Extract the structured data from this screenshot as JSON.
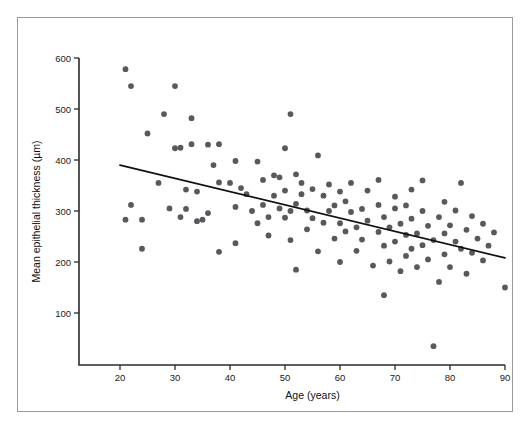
{
  "figure": {
    "frame_border_color": "#9a9a9a",
    "background_color": "#ffffff"
  },
  "caption": {
    "partial_text": ""
  },
  "chart_data": {
    "type": "scatter",
    "title": "",
    "subtitle": "",
    "xlabel": "Age (years)",
    "ylabel": "Mean epithelial thickness (µm)",
    "xlim": [
      13,
      92
    ],
    "ylim": [
      20,
      625
    ],
    "xticks": [
      20,
      30,
      40,
      50,
      60,
      70,
      80,
      90
    ],
    "xticklabels": [
      "20",
      "30",
      "40",
      "50",
      "60",
      "70",
      "80",
      "90"
    ],
    "yticks": [
      100,
      200,
      300,
      400,
      500,
      600
    ],
    "yticklabels": [
      "100",
      "200",
      "300",
      "400",
      "500",
      "600"
    ],
    "grid": false,
    "legend": null,
    "point_color": "#58585e",
    "point_size": 3.4,
    "annotations": [],
    "series": [
      {
        "name": "Mean epithelial thickness by age",
        "marker": "circle",
        "points": [
          [
            21,
            578
          ],
          [
            21,
            283
          ],
          [
            22,
            312
          ],
          [
            22,
            545
          ],
          [
            24,
            283
          ],
          [
            24,
            226
          ],
          [
            25,
            452
          ],
          [
            27,
            355
          ],
          [
            28,
            490
          ],
          [
            29,
            305
          ],
          [
            30,
            423
          ],
          [
            30,
            545
          ],
          [
            31,
            424
          ],
          [
            31,
            288
          ],
          [
            32,
            342
          ],
          [
            32,
            304
          ],
          [
            33,
            482
          ],
          [
            33,
            431
          ],
          [
            34,
            280
          ],
          [
            34,
            338
          ],
          [
            35,
            283
          ],
          [
            36,
            296
          ],
          [
            36,
            430
          ],
          [
            37,
            390
          ],
          [
            38,
            431
          ],
          [
            38,
            220
          ],
          [
            38,
            356
          ],
          [
            40,
            355
          ],
          [
            41,
            398
          ],
          [
            41,
            308
          ],
          [
            41,
            237
          ],
          [
            42,
            345
          ],
          [
            43,
            333
          ],
          [
            44,
            300
          ],
          [
            45,
            276
          ],
          [
            45,
            397
          ],
          [
            46,
            361
          ],
          [
            46,
            312
          ],
          [
            47,
            252
          ],
          [
            47,
            288
          ],
          [
            48,
            370
          ],
          [
            48,
            330
          ],
          [
            49,
            305
          ],
          [
            49,
            366
          ],
          [
            50,
            423
          ],
          [
            50,
            287
          ],
          [
            50,
            340
          ],
          [
            51,
            490
          ],
          [
            51,
            300
          ],
          [
            51,
            243
          ],
          [
            52,
            314
          ],
          [
            52,
            372
          ],
          [
            52,
            185
          ],
          [
            53,
            355
          ],
          [
            53,
            333
          ],
          [
            54,
            264
          ],
          [
            54,
            301
          ],
          [
            55,
            343
          ],
          [
            55,
            286
          ],
          [
            56,
            409
          ],
          [
            56,
            221
          ],
          [
            57,
            330
          ],
          [
            57,
            277
          ],
          [
            58,
            352
          ],
          [
            58,
            300
          ],
          [
            59,
            246
          ],
          [
            59,
            311
          ],
          [
            60,
            276
          ],
          [
            60,
            338
          ],
          [
            60,
            200
          ],
          [
            61,
            319
          ],
          [
            61,
            260
          ],
          [
            62,
            298
          ],
          [
            62,
            355
          ],
          [
            63,
            268
          ],
          [
            63,
            222
          ],
          [
            64,
            304
          ],
          [
            64,
            244
          ],
          [
            65,
            281
          ],
          [
            65,
            340
          ],
          [
            66,
            193
          ],
          [
            67,
            312
          ],
          [
            67,
            259
          ],
          [
            67,
            361
          ],
          [
            68,
            232
          ],
          [
            68,
            288
          ],
          [
            68,
            135
          ],
          [
            69,
            268
          ],
          [
            69,
            201
          ],
          [
            70,
            305
          ],
          [
            70,
            240
          ],
          [
            70,
            328
          ],
          [
            71,
            275
          ],
          [
            71,
            182
          ],
          [
            72,
            253
          ],
          [
            72,
            311
          ],
          [
            72,
            212
          ],
          [
            73,
            285
          ],
          [
            73,
            342
          ],
          [
            73,
            226
          ],
          [
            74,
            256
          ],
          [
            74,
            190
          ],
          [
            75,
            300
          ],
          [
            75,
            233
          ],
          [
            75,
            360
          ],
          [
            76,
            271
          ],
          [
            76,
            205
          ],
          [
            77,
            243
          ],
          [
            77,
            35
          ],
          [
            78,
            288
          ],
          [
            78,
            161
          ],
          [
            79,
            256
          ],
          [
            79,
            318
          ],
          [
            79,
            215
          ],
          [
            80,
            272
          ],
          [
            80,
            190
          ],
          [
            81,
            240
          ],
          [
            81,
            301
          ],
          [
            82,
            226
          ],
          [
            82,
            355
          ],
          [
            83,
            263
          ],
          [
            83,
            177
          ],
          [
            84,
            290
          ],
          [
            84,
            218
          ],
          [
            85,
            246
          ],
          [
            86,
            203
          ],
          [
            86,
            275
          ],
          [
            87,
            232
          ],
          [
            88,
            258
          ],
          [
            90,
            150
          ]
        ]
      }
    ],
    "trendline": {
      "name": "linear fit",
      "x": [
        20,
        90
      ],
      "y": [
        390,
        208
      ],
      "color": "#111111"
    }
  }
}
